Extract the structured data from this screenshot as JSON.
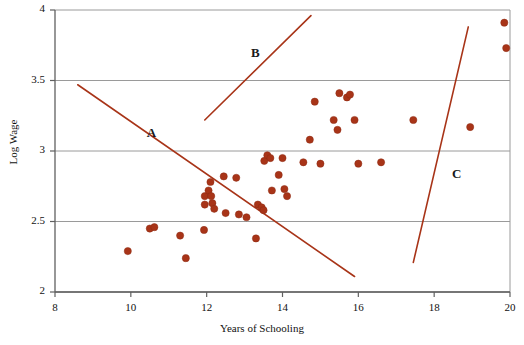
{
  "chart_data": {
    "type": "scatter",
    "title": "",
    "xlabel": "Years of Schooling",
    "ylabel": "Log Wage",
    "xlim": [
      8,
      20
    ],
    "ylim": [
      2,
      4
    ],
    "xticks": [
      8,
      10,
      12,
      14,
      16,
      18,
      20
    ],
    "yticks": [
      2,
      2.5,
      3,
      3.5,
      4
    ],
    "xtick_labels": [
      "8",
      "10",
      "12",
      "14",
      "16",
      "18",
      "20"
    ],
    "ytick_labels": [
      "2",
      "2.5",
      "3",
      "3.5",
      "4"
    ],
    "grid": "horizontal",
    "legend": "none",
    "marker_color": "#a83418",
    "marker_size": 6,
    "points": [
      [
        9.92,
        2.29
      ],
      [
        10.5,
        2.45
      ],
      [
        10.62,
        2.46
      ],
      [
        11.3,
        2.4
      ],
      [
        11.45,
        2.24
      ],
      [
        11.93,
        2.44
      ],
      [
        11.95,
        2.68
      ],
      [
        11.95,
        2.62
      ],
      [
        12.05,
        2.72
      ],
      [
        12.1,
        2.78
      ],
      [
        12.12,
        2.68
      ],
      [
        12.15,
        2.63
      ],
      [
        12.2,
        2.59
      ],
      [
        12.45,
        2.82
      ],
      [
        12.5,
        2.56
      ],
      [
        12.78,
        2.81
      ],
      [
        12.85,
        2.55
      ],
      [
        13.05,
        2.53
      ],
      [
        13.3,
        2.38
      ],
      [
        13.35,
        2.62
      ],
      [
        13.45,
        2.6
      ],
      [
        13.5,
        2.58
      ],
      [
        13.52,
        2.93
      ],
      [
        13.6,
        2.97
      ],
      [
        13.68,
        2.95
      ],
      [
        13.72,
        2.72
      ],
      [
        13.9,
        2.83
      ],
      [
        14.0,
        2.95
      ],
      [
        14.05,
        2.73
      ],
      [
        14.12,
        2.68
      ],
      [
        14.55,
        2.92
      ],
      [
        14.72,
        3.08
      ],
      [
        14.85,
        3.35
      ],
      [
        15.0,
        2.91
      ],
      [
        15.35,
        3.22
      ],
      [
        15.45,
        3.15
      ],
      [
        15.5,
        3.41
      ],
      [
        15.7,
        3.38
      ],
      [
        15.78,
        3.4
      ],
      [
        15.9,
        3.22
      ],
      [
        16.0,
        2.91
      ],
      [
        16.6,
        2.92
      ],
      [
        17.45,
        3.22
      ],
      [
        18.95,
        3.17
      ],
      [
        19.85,
        3.91
      ],
      [
        19.9,
        3.73
      ]
    ],
    "lines": [
      {
        "label": "A",
        "color": "#a83418",
        "x1": 8.6,
        "y1": 3.47,
        "x2": 15.9,
        "y2": 2.11,
        "label_x": 10.55,
        "label_y": 3.12
      },
      {
        "label": "B",
        "color": "#a83418",
        "x1": 11.95,
        "y1": 3.22,
        "x2": 14.75,
        "y2": 3.96,
        "label_x": 13.3,
        "label_y": 3.69
      },
      {
        "label": "C",
        "color": "#a83418",
        "x1": 17.45,
        "y1": 2.21,
        "x2": 18.9,
        "y2": 3.88,
        "label_x": 18.6,
        "label_y": 2.83
      }
    ]
  },
  "axes": {
    "x_title": "Years of Schooling",
    "y_title": "Log Wage"
  }
}
